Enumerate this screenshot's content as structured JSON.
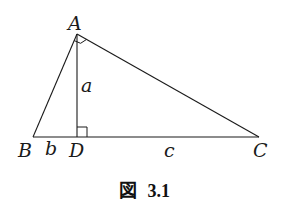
{
  "figure": {
    "caption_prefix": "図",
    "caption_number": "3.1",
    "caption": "図 3.1"
  },
  "points": {
    "A": {
      "label": "A",
      "x": 77,
      "y": 34
    },
    "B": {
      "label": "B",
      "x": 33,
      "y": 137
    },
    "C": {
      "label": "C",
      "x": 259,
      "y": 137
    },
    "D": {
      "label": "D",
      "x": 77,
      "y": 137
    }
  },
  "segment_labels": {
    "a": {
      "label": "a",
      "segment": "AD"
    },
    "b": {
      "label": "b",
      "segment": "BD"
    },
    "c": {
      "label": "c",
      "segment": "DC"
    }
  },
  "right_angles": [
    "BAC",
    "ADC"
  ],
  "colors": {
    "stroke": "#1a1a1a",
    "background": "#ffffff"
  }
}
